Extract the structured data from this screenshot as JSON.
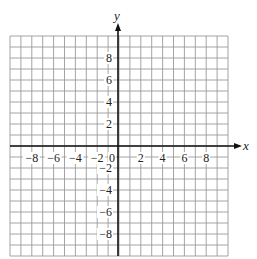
{
  "chart_data": {
    "type": "scatter",
    "title": "",
    "xlabel": "x",
    "ylabel": "y",
    "xlim": [
      -10,
      10
    ],
    "ylim": [
      -10,
      10
    ],
    "grid": true,
    "grid_step": 1,
    "x_ticks": [
      -8,
      -6,
      -4,
      -2,
      0,
      2,
      4,
      6,
      8
    ],
    "x_tick_labels": [
      "−8",
      "−6",
      "−4",
      "−2",
      "0",
      "2",
      "4",
      "6",
      "8"
    ],
    "y_ticks": [
      -8,
      -6,
      -4,
      -2,
      2,
      4,
      6,
      8
    ],
    "y_tick_labels": [
      "−8",
      "−6",
      "−4",
      "−2",
      "2",
      "4",
      "6",
      "8"
    ],
    "series": [],
    "legend": null
  },
  "colors": {
    "grid": "#9a9a9a",
    "axis": "#111111",
    "text": "#222222"
  }
}
